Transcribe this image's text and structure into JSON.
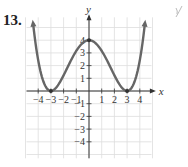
{
  "problem": {
    "number": "13."
  },
  "annotation": {
    "icon": "handwritten-check-mark-icon"
  },
  "chart_data": {
    "type": "line",
    "title": "",
    "xlabel": "x",
    "ylabel": "y",
    "xlim": [
      -4.8,
      5
    ],
    "ylim": [
      -5.2,
      6
    ],
    "grid": true,
    "x_ticks": [
      -4,
      -3,
      -2,
      -1,
      1,
      2,
      3,
      4
    ],
    "y_ticks": [
      -4,
      -3,
      -2,
      -1,
      1,
      2,
      3,
      4
    ],
    "x_tick_labels": [
      "−4",
      "−3",
      "−2",
      "−1",
      "1",
      "2",
      "3",
      "4"
    ],
    "y_tick_labels": [
      "−4",
      "−3",
      "−2",
      "−1",
      "1",
      "2",
      "3",
      "4"
    ],
    "series": [
      {
        "name": "f(x)",
        "description": "Polynomial curve with double roots at x = -3 and x = 3 and local maximum at (0, 4); arrows at both ends pointing up",
        "key_points": [
          {
            "x": -3,
            "y": 0,
            "marker": true
          },
          {
            "x": 0,
            "y": 4,
            "marker": true
          },
          {
            "x": 3,
            "y": 0,
            "marker": true
          }
        ],
        "x": [
          -4.4,
          -4,
          -3.5,
          -3,
          -2.5,
          -2,
          -1.5,
          -1,
          -0.5,
          0,
          0.5,
          1,
          1.5,
          2,
          2.5,
          3,
          3.5,
          4,
          4.4
        ],
        "y": [
          5.3,
          2.42,
          0.51,
          0,
          0.37,
          1.23,
          2.25,
          3.16,
          3.77,
          4,
          3.77,
          3.16,
          2.25,
          1.23,
          0.37,
          0,
          0.51,
          2.42,
          5.3
        ],
        "end_arrows": true,
        "color": "#666666"
      }
    ],
    "colors": {
      "curve": "#666666",
      "grid": "#dddddd",
      "axis": "#333333"
    }
  }
}
